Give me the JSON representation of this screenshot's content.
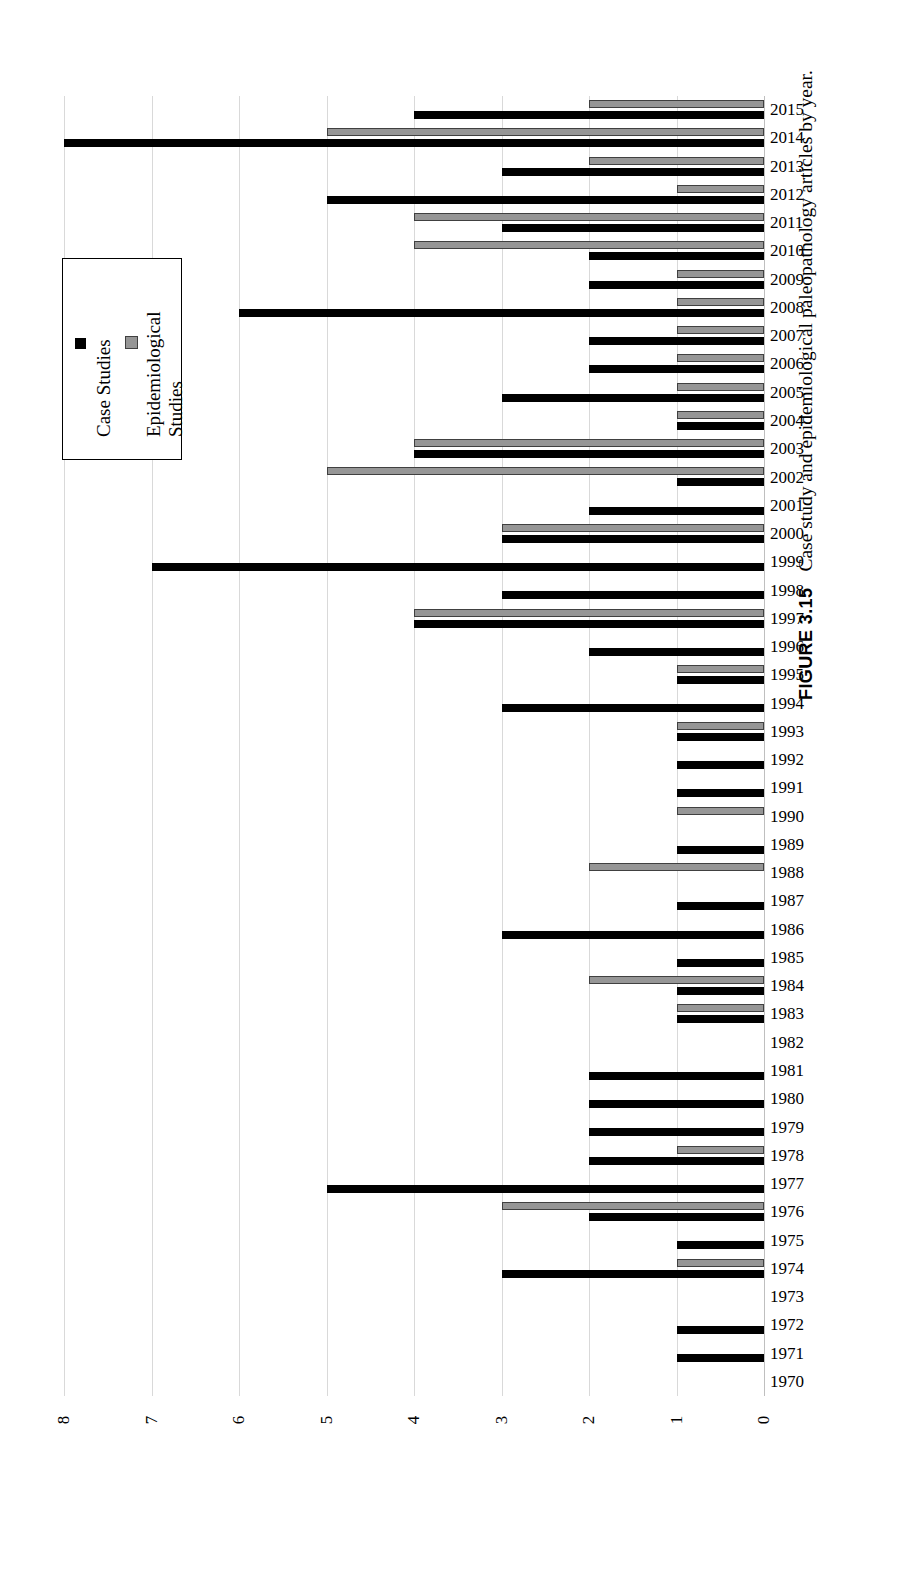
{
  "figure": {
    "number": "FIGURE 3.15",
    "caption": "Case study and epidemiological paleopathology articles by year."
  },
  "legend": {
    "position": "upper-left",
    "items": [
      {
        "label": "Case Studies",
        "color": "#000000",
        "key": "case"
      },
      {
        "label": "Epidemiological\nStudies",
        "color": "#969696",
        "key": "epi"
      }
    ]
  },
  "axis": {
    "value_ticks": [
      "8",
      "7",
      "6",
      "5",
      "4",
      "3",
      "2",
      "1",
      "0"
    ],
    "direction": "right-to-left",
    "min": 0,
    "max": 8
  },
  "chart_data": {
    "type": "bar",
    "orientation": "horizontal",
    "title": "Case study and epidemiological paleopathology articles by year.",
    "xlabel": "Number of articles",
    "ylabel": "Year",
    "xlim": [
      0,
      8
    ],
    "grid": true,
    "legend_position": "upper-left",
    "reversed_x_axis": true,
    "categories": [
      "2015",
      "2014",
      "2013",
      "2012",
      "2011",
      "2010",
      "2009",
      "2008",
      "2007",
      "2006",
      "2005",
      "2004",
      "2003",
      "2002",
      "2001",
      "2000",
      "1999",
      "1998",
      "1997",
      "1996",
      "1995",
      "1994",
      "1993",
      "1992",
      "1991",
      "1990",
      "1989",
      "1988",
      "1987",
      "1986",
      "1985",
      "1984",
      "1983",
      "1982",
      "1981",
      "1980",
      "1979",
      "1978",
      "1977",
      "1976",
      "1975",
      "1974",
      "1973",
      "1972",
      "1971",
      "1970"
    ],
    "series": [
      {
        "name": "Case Studies",
        "color": "#000000",
        "values": [
          4,
          8,
          3,
          5,
          3,
          2,
          2,
          6,
          2,
          2,
          3,
          1,
          4,
          1,
          2,
          3,
          7,
          3,
          4,
          2,
          1,
          3,
          1,
          1,
          1,
          0,
          1,
          0,
          1,
          3,
          1,
          1,
          1,
          0,
          2,
          2,
          2,
          2,
          5,
          2,
          1,
          3,
          0,
          1,
          1,
          0
        ]
      },
      {
        "name": "Epidemiological Studies",
        "color": "#969696",
        "values": [
          2,
          5,
          2,
          1,
          4,
          4,
          1,
          1,
          1,
          1,
          1,
          1,
          4,
          5,
          0,
          3,
          0,
          0,
          4,
          0,
          1,
          0,
          1,
          0,
          0,
          1,
          0,
          2,
          0,
          0,
          0,
          2,
          1,
          0,
          0,
          0,
          0,
          1,
          0,
          3,
          0,
          1,
          0,
          0,
          0,
          0
        ]
      }
    ]
  }
}
